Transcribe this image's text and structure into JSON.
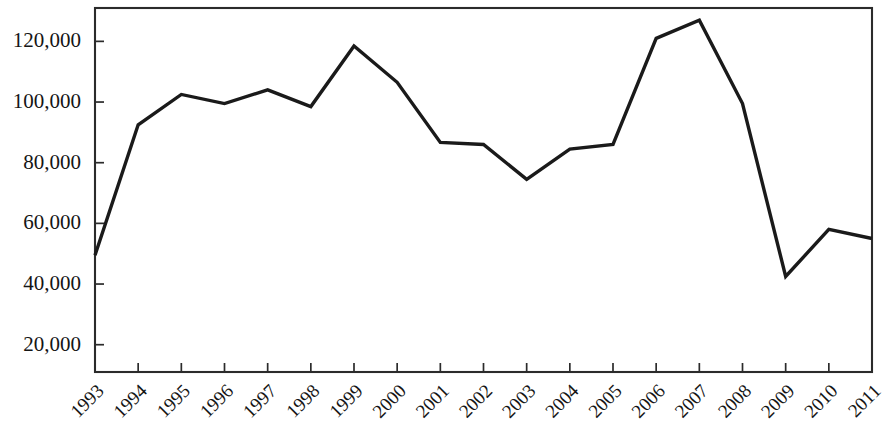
{
  "chart_data": {
    "type": "line",
    "title": "",
    "subtitle": "",
    "xlabel": "",
    "ylabel": "",
    "categories": [
      "1993",
      "1994",
      "1995",
      "1996",
      "1997",
      "1998",
      "1999",
      "2000",
      "2001",
      "2002",
      "2003",
      "2004",
      "2005",
      "2006",
      "2007",
      "2008",
      "2009",
      "2010",
      "2011"
    ],
    "values": [
      49500,
      92500,
      102500,
      99500,
      104000,
      98500,
      118500,
      106500,
      86700,
      86000,
      74500,
      84500,
      86000,
      121000,
      127000,
      99500,
      42500,
      58000,
      55000
    ],
    "series": [
      {
        "name": "series-1",
        "values": [
          49500,
          92500,
          102500,
          99500,
          104000,
          98500,
          118500,
          106500,
          86700,
          86000,
          74500,
          84500,
          86000,
          121000,
          127000,
          99500,
          42500,
          58000,
          55000
        ]
      }
    ],
    "ylim": [
      11000,
      131000
    ],
    "xlim_index": [
      0,
      18
    ],
    "yticks": [
      20000,
      40000,
      60000,
      80000,
      100000,
      120000
    ],
    "ytick_labels": [
      "20,000",
      "40,000",
      "60,000",
      "80,000",
      "100,000",
      "120,000"
    ],
    "grid": false,
    "legend": false,
    "legend_position": "none",
    "line_color": "#1a1a1a",
    "frame_color": "#2b2b2b",
    "background_color": "#ffffff",
    "xtick_label_rotation": -45
  }
}
